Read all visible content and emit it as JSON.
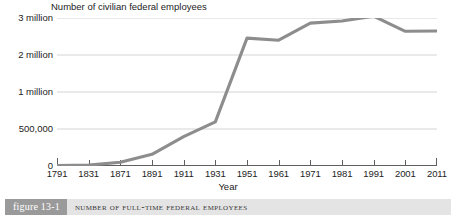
{
  "figure": {
    "badge_label": "figure 13-1",
    "caption": "Number of Full-Time Federal Employees"
  },
  "colors": {
    "line": "#8d8d8d",
    "gridline": "#d4d4d4",
    "axis": "#5f5f5f",
    "badge_background": "#9a9a9a",
    "caption_background": "#e4e4e4",
    "text": "#1d1d1d"
  },
  "chart_data": {
    "type": "line",
    "title": "Number of civilian federal employees",
    "xlabel": "Year",
    "ylabel": "",
    "categories": [
      "1791",
      "1831",
      "1871",
      "1891",
      "1911",
      "1931",
      "1951",
      "1961",
      "1971",
      "1981",
      "1991",
      "2001",
      "2011"
    ],
    "values": [
      4479,
      11491,
      51020,
      157442,
      395905,
      596746,
      2456000,
      2400000,
      2862000,
      2920000,
      3048000,
      2640000,
      2650000
    ],
    "value_labels": [
      "4,479",
      "11,491",
      "51,020",
      "157,442",
      "395,905",
      "596,746",
      "2,456,000",
      "2,400,000",
      "2,862,000",
      "2,920,000",
      "3,048,000",
      "2,640,000",
      "2,650,000"
    ],
    "ytick_labels": [
      "0",
      "500,000",
      "1 million",
      "2 million",
      "3 million"
    ],
    "ytick_values": [
      0,
      500000,
      1000000,
      2000000,
      3000000
    ],
    "y_scale": "nonlinear-evenly-spaced-ticks",
    "grid": true,
    "legend": "none"
  }
}
